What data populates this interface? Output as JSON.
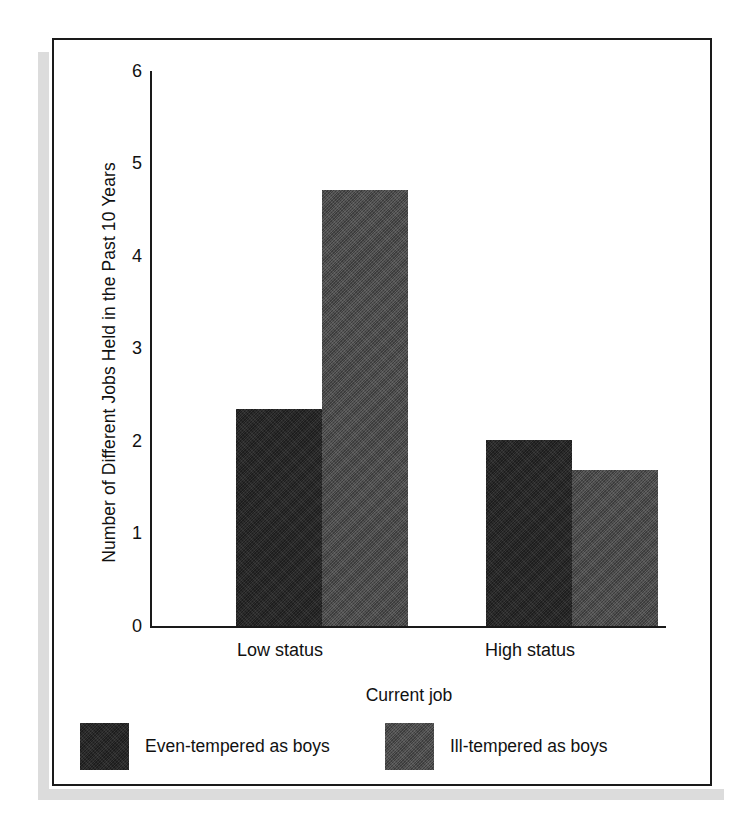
{
  "chart_data": {
    "type": "bar",
    "title": "",
    "xlabel": "Current job",
    "ylabel": "Number of Different Jobs Held in the Past 10 Years",
    "categories": [
      "Low status",
      "High status"
    ],
    "series": [
      {
        "name": "Even-tempered as boys",
        "values": [
          2.5,
          2.15
        ],
        "color": "#2d2d2d"
      },
      {
        "name": "Ill-tempered as boys",
        "values": [
          5.03,
          1.8
        ],
        "color": "#565656"
      }
    ],
    "ylim": [
      0,
      6.4
    ],
    "yticks": [
      0,
      1,
      2,
      3,
      4,
      5,
      6
    ],
    "ytick_labels": [
      "0",
      "1",
      "2",
      "3",
      "4",
      "5",
      "6"
    ],
    "grid": false,
    "legend_position": "bottom-outside"
  },
  "axes": {
    "y_title": "Number of Different Jobs Held in the Past 10 Years",
    "x_title": "Current job",
    "y_tick_labels": [
      "6",
      "5",
      "4",
      "3",
      "2",
      "1",
      "0"
    ],
    "x_tick_labels": [
      "Low status",
      "High status"
    ]
  },
  "legend": {
    "items": [
      {
        "label": "Even-tempered as boys",
        "swatch": "dark"
      },
      {
        "label": "Ill-tempered as boys",
        "swatch": "gray"
      }
    ]
  },
  "colors": {
    "series_even_tempered": "#2d2d2d",
    "series_ill_tempered": "#565656",
    "frame": "#1a1a1a",
    "background": "#ffffff",
    "shadow": "#dcdcdc"
  }
}
